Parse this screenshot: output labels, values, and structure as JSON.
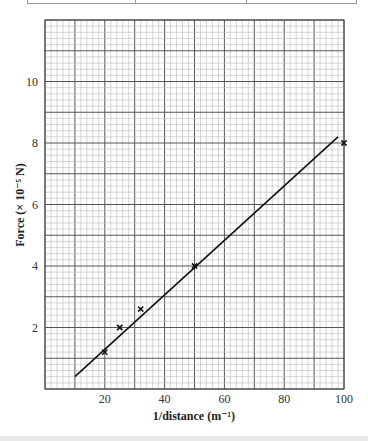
{
  "chart_data": {
    "type": "scatter",
    "title": "",
    "xlabel": "1/distance (m⁻¹)",
    "ylabel": "Force (× 10⁻⁵ N)",
    "xlim": [
      0,
      100
    ],
    "ylim": [
      0,
      12
    ],
    "x_ticks": [
      20,
      40,
      60,
      80,
      100
    ],
    "y_ticks": [
      2,
      4,
      6,
      8,
      10
    ],
    "grid": {
      "major_x": 10,
      "minor_x": 2,
      "major_y": 1,
      "minor_y": 0.2
    },
    "series": [
      {
        "name": "measured",
        "marker": "x",
        "points": [
          [
            20,
            1.2
          ],
          [
            25,
            2.0
          ],
          [
            32,
            2.6
          ],
          [
            50,
            4.0
          ],
          [
            100,
            8.0
          ]
        ]
      },
      {
        "name": "best-fit line",
        "type": "line",
        "points": [
          [
            10,
            0.4
          ],
          [
            98,
            8.2
          ]
        ]
      }
    ]
  },
  "labels": {
    "x_axis_title": "1/distance (m⁻¹)",
    "y_axis_title": "Force (× 10⁻⁵ N)",
    "x_ticks": [
      "20",
      "40",
      "60",
      "80",
      "100"
    ],
    "y_ticks": [
      "2",
      "4",
      "6",
      "8",
      "10"
    ]
  }
}
